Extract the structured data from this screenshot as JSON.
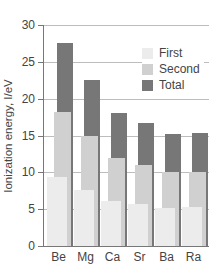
{
  "chart_data": {
    "type": "bar",
    "title": "",
    "xlabel": "",
    "ylabel": "Ionization energy, I/eV",
    "ylim": [
      0,
      30
    ],
    "yticks": [
      0,
      5,
      10,
      15,
      20,
      25,
      30
    ],
    "grid": true,
    "legend_position": "upper right",
    "categories": [
      "Be",
      "Mg",
      "Ca",
      "Sr",
      "Ba",
      "Ra"
    ],
    "series": [
      {
        "name": "First",
        "color": "#ececec",
        "values": [
          9.3,
          7.6,
          6.1,
          5.7,
          5.2,
          5.3
        ]
      },
      {
        "name": "Second",
        "color": "#d0d0d0",
        "values": [
          18.2,
          15.0,
          11.9,
          11.0,
          10.0,
          10.1
        ]
      },
      {
        "name": "Total",
        "color": "#777777",
        "values": [
          27.5,
          22.6,
          18.0,
          16.7,
          15.2,
          15.4
        ]
      }
    ]
  },
  "legend": {
    "items": [
      {
        "label": "First",
        "color": "#ececec"
      },
      {
        "label": "Second",
        "color": "#d0d0d0"
      },
      {
        "label": "Total",
        "color": "#777777"
      }
    ]
  }
}
